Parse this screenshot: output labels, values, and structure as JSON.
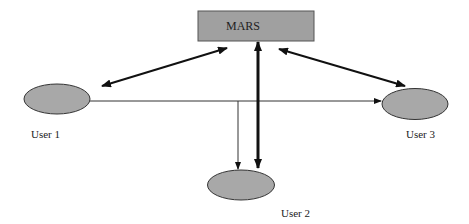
{
  "diagram": {
    "server": {
      "label": "MARS",
      "fill": "#a0a0a0",
      "stroke": "#555555"
    },
    "users": [
      {
        "id": "user1",
        "label": "User 1"
      },
      {
        "id": "user2",
        "label": "User 2"
      },
      {
        "id": "user3",
        "label": "User 3"
      }
    ],
    "node_fill": "#a8a8a8",
    "node_stroke": "#333333",
    "edges": [
      {
        "from": "user1",
        "to": "MARS",
        "style": "thick",
        "direction": "bidirectional"
      },
      {
        "from": "user3",
        "to": "MARS",
        "style": "thick",
        "direction": "bidirectional"
      },
      {
        "from": "user2",
        "to": "MARS",
        "style": "thick",
        "direction": "bidirectional"
      },
      {
        "from": "user1",
        "to": "user3",
        "style": "thin",
        "direction": "forward"
      },
      {
        "from": "user1",
        "to": "user2",
        "style": "thin",
        "direction": "forward"
      }
    ]
  }
}
